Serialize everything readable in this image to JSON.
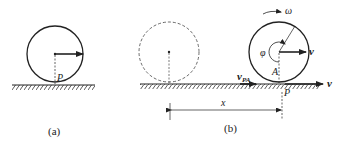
{
  "figure_a": {
    "caption": "(a)",
    "contact_point_label": "P"
  },
  "figure_b": {
    "caption": "(b)",
    "angular_velocity_label": "ω",
    "angle_label": "φ",
    "point_A_label": "A",
    "contact_point_label": "P",
    "center_velocity_label": "v",
    "ground_velocity_label": "v",
    "relative_velocity_label": "v",
    "relative_velocity_subscript": "PA",
    "displacement_label": "x"
  },
  "colors": {
    "ink": "#222222",
    "background": "#ffffff"
  }
}
